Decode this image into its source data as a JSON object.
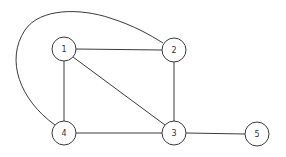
{
  "diagram": {
    "type": "undirected-graph",
    "stroke_color": "#3a3a3a",
    "background": "#ffffff",
    "nodes": [
      {
        "id": "1",
        "label": "1",
        "x": 64,
        "y": 49,
        "r": 12
      },
      {
        "id": "2",
        "label": "2",
        "x": 174,
        "y": 50,
        "r": 12
      },
      {
        "id": "3",
        "label": "3",
        "x": 174,
        "y": 133,
        "r": 12
      },
      {
        "id": "4",
        "label": "4",
        "x": 64,
        "y": 133,
        "r": 12
      },
      {
        "id": "5",
        "label": "5",
        "x": 257,
        "y": 134,
        "r": 12
      }
    ],
    "edges": [
      {
        "from": "1",
        "to": "2",
        "style": "straight"
      },
      {
        "from": "1",
        "to": "4",
        "style": "straight"
      },
      {
        "from": "1",
        "to": "3",
        "style": "straight"
      },
      {
        "from": "2",
        "to": "3",
        "style": "straight"
      },
      {
        "from": "4",
        "to": "3",
        "style": "straight"
      },
      {
        "from": "3",
        "to": "5",
        "style": "straight"
      },
      {
        "from": "4",
        "to": "2",
        "style": "curved"
      }
    ]
  }
}
